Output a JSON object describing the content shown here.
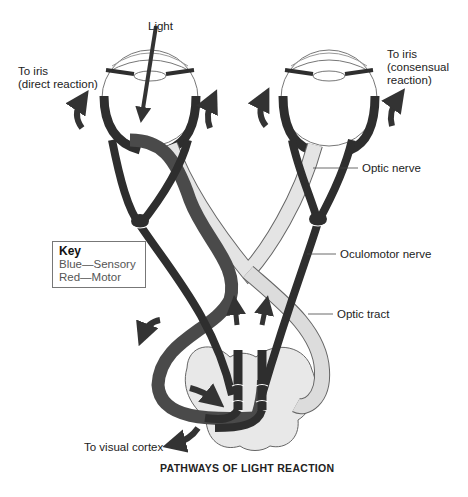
{
  "diagram": {
    "title": "PATHWAYS OF LIGHT REACTION",
    "labels": {
      "light": "Light",
      "to_iris_direct_line1": "To iris",
      "to_iris_direct_line2": "(direct reaction)",
      "to_iris_consensual_line1": "To iris",
      "to_iris_consensual_line2": "(consensual",
      "to_iris_consensual_line3": "reaction)",
      "optic_nerve": "Optic nerve",
      "oculomotor_nerve": "Oculomotor nerve",
      "optic_tract": "Optic tract",
      "to_visual_cortex": "To visual cortex"
    },
    "key": {
      "title": "Key",
      "entries": [
        {
          "color": "Blue",
          "meaning": "Sensory",
          "text": "Blue—Sensory"
        },
        {
          "color": "Red",
          "meaning": "Motor",
          "text": "Red—Motor"
        }
      ]
    },
    "colors": {
      "motor_pathway": "#2e2e2e",
      "sensory_pathway_dark": "#4a4a4a",
      "sensory_pathway_light": "#e4e4e4",
      "midbrain": "#e8e8e8",
      "outline": "#555555"
    }
  }
}
